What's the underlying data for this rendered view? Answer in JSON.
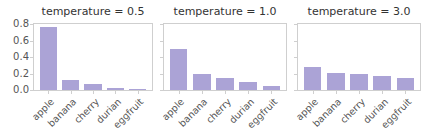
{
  "chart_data": [
    {
      "type": "bar",
      "title": "temperature = 0.5",
      "categories": [
        "apple",
        "banana",
        "cherry",
        "durian",
        "eggfruit"
      ],
      "values": [
        0.76,
        0.12,
        0.07,
        0.03,
        0.005
      ],
      "xlabel": "",
      "ylabel": "",
      "ylim": [
        0,
        0.8
      ],
      "yticks": [
        "0.0",
        "0.2",
        "0.4",
        "0.6",
        "0.8"
      ],
      "grid": false
    },
    {
      "type": "bar",
      "title": "temperature = 1.0",
      "categories": [
        "apple",
        "banana",
        "cherry",
        "durian",
        "eggfruit"
      ],
      "values": [
        0.5,
        0.2,
        0.15,
        0.1,
        0.05
      ],
      "xlabel": "",
      "ylabel": "",
      "ylim": [
        0,
        0.8
      ],
      "sharey": true,
      "grid": false
    },
    {
      "type": "bar",
      "title": "temperature = 3.0",
      "categories": [
        "apple",
        "banana",
        "cherry",
        "durian",
        "eggfruit"
      ],
      "values": [
        0.28,
        0.21,
        0.19,
        0.17,
        0.14
      ],
      "xlabel": "",
      "ylabel": "",
      "ylim": [
        0,
        0.8
      ],
      "sharey": true,
      "grid": false
    }
  ],
  "style": {
    "bar_color": "#aba3d6",
    "frame_color": "#cfcfcf"
  }
}
